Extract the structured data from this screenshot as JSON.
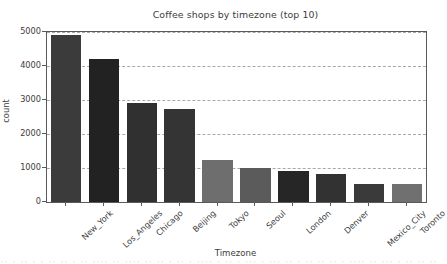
{
  "chart_data": {
    "type": "bar",
    "title": "Coffee shops by timezone (top 10)",
    "xlabel": "Timezone",
    "ylabel": "count",
    "categories": [
      "New_York",
      "Los_Angeles",
      "Chicago",
      "Beijing",
      "Tokyo",
      "Seoul",
      "London",
      "Denver",
      "Mexico_City",
      "Toronto"
    ],
    "values": [
      4910,
      4200,
      2910,
      2740,
      1230,
      1000,
      920,
      820,
      540,
      540
    ],
    "bar_colors": [
      "#3b3b3b",
      "#222222",
      "#303030",
      "#343434",
      "#6e6e6e",
      "#5b5b5b",
      "#262626",
      "#323232",
      "#3a3a3a",
      "#707070"
    ],
    "ylim": [
      0,
      5000
    ],
    "yticks": [
      0,
      1000,
      2000,
      3000,
      4000,
      5000
    ],
    "ytick_labels": [
      "0",
      "1000",
      "2000",
      "3000",
      "4000",
      "5000"
    ],
    "grid": "horizontal-dashed",
    "legend": "none",
    "tick_label_rotation": -43
  },
  "axes": {
    "spine_color": "#5a5a5a",
    "grid_color": "#9a9a9a",
    "text_color": "#3c3c3c",
    "background": "#ffffff"
  },
  "bottom_artifact": {
    "text": "·· ·  ·· · ·   ·· ·· ·    ·· ···· ·· ···· ·· ·· ·  ·· · ···· ·  ·· ·  ··· · ··· ·· · ·· ·· ·· ·  ···· ·· ··· ·  ·· ·· ··· ·· ·  ··· ·"
  }
}
